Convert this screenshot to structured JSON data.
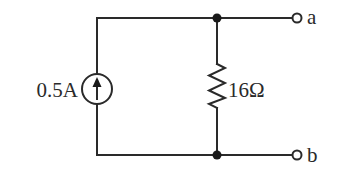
{
  "diagram": {
    "type": "circuit",
    "colors": {
      "line": "#2a2a2a",
      "node": "#1a1a1a",
      "background": "#ffffff"
    },
    "source": {
      "kind": "current-source",
      "label": "0.5A",
      "direction": "up"
    },
    "resistor": {
      "label": "16Ω"
    },
    "terminals": [
      {
        "label": "a"
      },
      {
        "label": "b"
      }
    ]
  }
}
